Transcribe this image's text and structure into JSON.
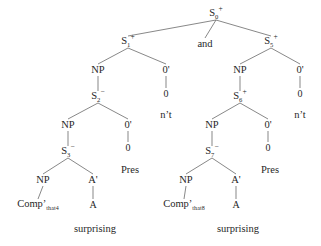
{
  "figure": {
    "type": "syntax-tree",
    "background_color": "#ffffff",
    "line_color": "#555555",
    "text_color": "#1f1f1f",
    "width": 321,
    "height": 246
  },
  "nodes": [
    {
      "id": "n0",
      "label": "S",
      "sub": "0",
      "sup": "+",
      "x": 216,
      "y": 14,
      "kind": "category"
    },
    {
      "id": "n1",
      "label": "S",
      "sub": "1",
      "sup": "+",
      "x": 128,
      "y": 42,
      "kind": "category"
    },
    {
      "id": "nand",
      "label": "and",
      "sub": "",
      "sup": "",
      "x": 205,
      "y": 44,
      "kind": "word"
    },
    {
      "id": "n5",
      "label": "S",
      "sub": "5",
      "sup": "+",
      "x": 271,
      "y": 42,
      "kind": "category"
    },
    {
      "id": "l_np1",
      "label": "NP",
      "sub": "",
      "sup": "",
      "x": 98,
      "y": 70,
      "kind": "category"
    },
    {
      "id": "l_zb1",
      "label": "0'",
      "sub": "",
      "sup": "",
      "x": 166,
      "y": 70,
      "kind": "category"
    },
    {
      "id": "l_z1",
      "label": "0",
      "sub": "",
      "sup": "",
      "x": 166,
      "y": 94,
      "kind": "terminal"
    },
    {
      "id": "l_nt",
      "label": "n’t",
      "sub": "",
      "sup": "",
      "x": 166,
      "y": 115,
      "kind": "word"
    },
    {
      "id": "l_s2",
      "label": "S",
      "sub": "2",
      "sup": "−",
      "x": 98,
      "y": 97,
      "kind": "category"
    },
    {
      "id": "l_np2",
      "label": "NP",
      "sub": "",
      "sup": "",
      "x": 68,
      "y": 125,
      "kind": "category"
    },
    {
      "id": "l_zb2",
      "label": "0'",
      "sub": "",
      "sup": "",
      "x": 128,
      "y": 125,
      "kind": "category"
    },
    {
      "id": "l_z2",
      "label": "0",
      "sub": "",
      "sup": "",
      "x": 128,
      "y": 148,
      "kind": "terminal"
    },
    {
      "id": "l_pres",
      "label": "Pres",
      "sub": "",
      "sup": "",
      "x": 130,
      "y": 170,
      "kind": "word"
    },
    {
      "id": "l_s3",
      "label": "S",
      "sub": "3",
      "sup": "−",
      "x": 68,
      "y": 152,
      "kind": "category"
    },
    {
      "id": "l_np3",
      "label": "NP",
      "sub": "",
      "sup": "",
      "x": 43,
      "y": 180,
      "kind": "category"
    },
    {
      "id": "l_ab",
      "label": "A'",
      "sub": "",
      "sup": "",
      "x": 93,
      "y": 180,
      "kind": "category"
    },
    {
      "id": "l_comp",
      "label": "Comp’",
      "sub": "that4",
      "sup": "",
      "x": 38,
      "y": 205,
      "kind": "comp"
    },
    {
      "id": "l_a",
      "label": "A",
      "sub": "",
      "sup": "",
      "x": 93,
      "y": 205,
      "kind": "terminal"
    },
    {
      "id": "l_word",
      "label": "surprising",
      "sub": "",
      "sup": "",
      "x": 95,
      "y": 229,
      "kind": "word"
    },
    {
      "id": "r_np1",
      "label": "NP",
      "sub": "",
      "sup": "",
      "x": 240,
      "y": 70,
      "kind": "category"
    },
    {
      "id": "r_zb1",
      "label": "0'",
      "sub": "",
      "sup": "",
      "x": 300,
      "y": 70,
      "kind": "category"
    },
    {
      "id": "r_z1",
      "label": "0",
      "sub": "",
      "sup": "",
      "x": 300,
      "y": 94,
      "kind": "terminal"
    },
    {
      "id": "r_nt",
      "label": "n’t",
      "sub": "",
      "sup": "",
      "x": 300,
      "y": 115,
      "kind": "word"
    },
    {
      "id": "r_s6",
      "label": "S",
      "sub": "6",
      "sup": "+",
      "x": 240,
      "y": 97,
      "kind": "category"
    },
    {
      "id": "r_np2",
      "label": "NP",
      "sub": "",
      "sup": "",
      "x": 212,
      "y": 125,
      "kind": "category"
    },
    {
      "id": "r_zb2",
      "label": "0'",
      "sub": "",
      "sup": "",
      "x": 268,
      "y": 125,
      "kind": "category"
    },
    {
      "id": "r_z2",
      "label": "0",
      "sub": "",
      "sup": "",
      "x": 268,
      "y": 148,
      "kind": "terminal"
    },
    {
      "id": "r_pres",
      "label": "Pres",
      "sub": "",
      "sup": "",
      "x": 270,
      "y": 170,
      "kind": "word"
    },
    {
      "id": "r_s7",
      "label": "S",
      "sub": "7",
      "sup": "−",
      "x": 212,
      "y": 152,
      "kind": "category"
    },
    {
      "id": "r_np3",
      "label": "NP",
      "sub": "",
      "sup": "",
      "x": 186,
      "y": 180,
      "kind": "category"
    },
    {
      "id": "r_ab",
      "label": "A'",
      "sub": "",
      "sup": "",
      "x": 236,
      "y": 180,
      "kind": "category"
    },
    {
      "id": "r_comp",
      "label": "Comp’",
      "sub": "that8",
      "sup": "",
      "x": 184,
      "y": 205,
      "kind": "comp"
    },
    {
      "id": "r_a",
      "label": "A",
      "sub": "",
      "sup": "",
      "x": 236,
      "y": 205,
      "kind": "terminal"
    },
    {
      "id": "r_word",
      "label": "surprising",
      "sub": "",
      "sup": "",
      "x": 238,
      "y": 229,
      "kind": "word"
    }
  ],
  "edges": [
    {
      "from": "n0",
      "to": "n1"
    },
    {
      "from": "n0",
      "to": "nand"
    },
    {
      "from": "n0",
      "to": "n5"
    },
    {
      "from": "n1",
      "to": "l_np1"
    },
    {
      "from": "n1",
      "to": "l_zb1"
    },
    {
      "from": "l_zb1",
      "to": "l_z1"
    },
    {
      "from": "l_np1",
      "to": "l_s2"
    },
    {
      "from": "l_s2",
      "to": "l_np2"
    },
    {
      "from": "l_s2",
      "to": "l_zb2"
    },
    {
      "from": "l_zb2",
      "to": "l_z2"
    },
    {
      "from": "l_np2",
      "to": "l_s3"
    },
    {
      "from": "l_s3",
      "to": "l_np3"
    },
    {
      "from": "l_s3",
      "to": "l_ab"
    },
    {
      "from": "l_np3",
      "to": "l_comp"
    },
    {
      "from": "l_ab",
      "to": "l_a"
    },
    {
      "from": "n5",
      "to": "r_np1"
    },
    {
      "from": "n5",
      "to": "r_zb1"
    },
    {
      "from": "r_zb1",
      "to": "r_z1"
    },
    {
      "from": "r_np1",
      "to": "r_s6"
    },
    {
      "from": "r_s6",
      "to": "r_np2"
    },
    {
      "from": "r_s6",
      "to": "r_zb2"
    },
    {
      "from": "r_zb2",
      "to": "r_z2"
    },
    {
      "from": "r_np2",
      "to": "r_s7"
    },
    {
      "from": "r_s7",
      "to": "r_np3"
    },
    {
      "from": "r_s7",
      "to": "r_ab"
    },
    {
      "from": "r_np3",
      "to": "r_comp"
    },
    {
      "from": "r_ab",
      "to": "r_a"
    }
  ],
  "top_artifact": " "
}
